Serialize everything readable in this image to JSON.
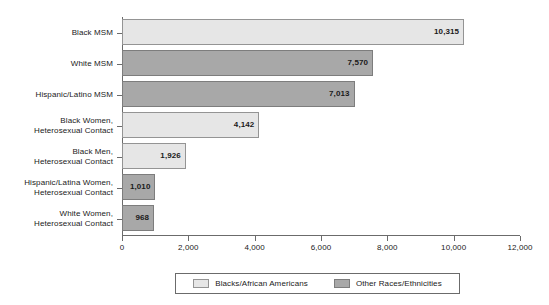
{
  "chart_data": {
    "type": "bar",
    "orientation": "horizontal",
    "title": "",
    "subtitle": "",
    "xlabel": "",
    "ylabel": "",
    "xlim": [
      0,
      12000
    ],
    "grid": false,
    "x_ticks": [
      "0",
      "2,000",
      "4,000",
      "6,000",
      "8,000",
      "10,000",
      "12,000"
    ],
    "x_tick_values": [
      0,
      2000,
      4000,
      6000,
      8000,
      10000,
      12000
    ],
    "legend_position": "bottom",
    "categories": [
      "Black MSM",
      "White MSM",
      "Hispanic/Latino MSM",
      "Black Women,\nHeterosexual Contact",
      "Black Men,\nHeterosexual Contact",
      "Hispanic/Latina Women,\nHeterosexual Contact",
      "White Women,\nHeterosexual Contact"
    ],
    "values": [
      10315,
      7570,
      7013,
      4142,
      1926,
      1010,
      968
    ],
    "value_labels": [
      "10,315",
      "7,570",
      "7,013",
      "4,142",
      "1,926",
      "1,010",
      "968"
    ],
    "group_of_bar": [
      "Blacks/African Americans",
      "Other Races/Ethnicities",
      "Other Races/Ethnicities",
      "Blacks/African Americans",
      "Blacks/African Americans",
      "Other Races/Ethnicities",
      "Other Races/Ethnicities"
    ],
    "legend": [
      {
        "label": "Blacks/African Americans",
        "swatch": "light",
        "color": "#e6e6e6"
      },
      {
        "label": "Other Races/Ethnicities",
        "swatch": "dark",
        "color": "#a8a8a8"
      }
    ],
    "colors": {
      "light_gray": "#e6e6e6",
      "dark_gray": "#a8a8a8",
      "axis": "#6b6b6b",
      "bar_border": "#8c8c8c",
      "text": "#1a1a1a",
      "background": "#ffffff"
    }
  }
}
